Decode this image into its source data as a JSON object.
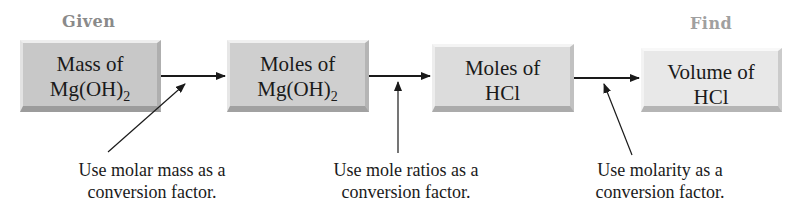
{
  "labels": {
    "given": "Given",
    "find": "Find"
  },
  "colors": {
    "given_label": "#8a8a8a",
    "find_label": "#a0a0a0",
    "arrow": "#1a1a1a"
  },
  "boxes": [
    {
      "line1": "Mass of",
      "line2": "Mg(OH)",
      "sub": "2",
      "bg": "#c8c8c8"
    },
    {
      "line1": "Moles of",
      "line2": "Mg(OH)",
      "sub": "2",
      "bg": "#cfcfcf"
    },
    {
      "line1": "Moles of",
      "line2": "HCl",
      "sub": "",
      "bg": "#dcdcdc"
    },
    {
      "line1": "Volume of",
      "line2": "HCl",
      "sub": "",
      "bg": "#e8e8e8"
    }
  ],
  "notes": [
    {
      "line1": "Use molar mass as a",
      "line2": "conversion factor."
    },
    {
      "line1": "Use mole ratios as a",
      "line2": "conversion factor."
    },
    {
      "line1": "Use molarity as a",
      "line2": "conversion factor."
    }
  ]
}
